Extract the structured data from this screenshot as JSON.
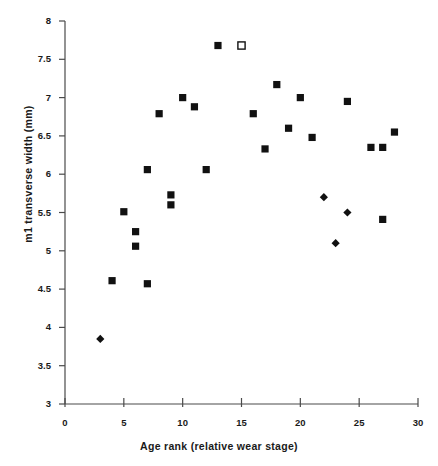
{
  "chart_data": {
    "type": "scatter",
    "title": "",
    "xlabel": "Age rank (relative wear stage)",
    "ylabel": "m1 transverse width  (mm)",
    "xlim": [
      0,
      30
    ],
    "ylim": [
      3,
      8
    ],
    "xticks": [
      0,
      5,
      10,
      15,
      20,
      25,
      30
    ],
    "yticks": [
      3,
      3.5,
      4,
      4.5,
      5,
      5.5,
      6,
      6.5,
      7,
      7.5,
      8
    ],
    "xtick_labels": [
      "0",
      "5",
      "10",
      "15",
      "20",
      "25",
      "30"
    ],
    "ytick_labels": [
      "3",
      "3.5",
      "4",
      "4.5",
      "5",
      "5.5",
      "6",
      "6.5",
      "7",
      "7.5",
      "8"
    ],
    "grid": false,
    "legend": null,
    "series": [
      {
        "name": "filled-square",
        "marker": "filled-square",
        "color": "#111111",
        "points": [
          {
            "x": 4.0,
            "y": 4.61
          },
          {
            "x": 5.0,
            "y": 5.51
          },
          {
            "x": 6.0,
            "y": 5.25
          },
          {
            "x": 6.0,
            "y": 5.06
          },
          {
            "x": 7.0,
            "y": 4.57
          },
          {
            "x": 7.0,
            "y": 6.06
          },
          {
            "x": 8.0,
            "y": 6.79
          },
          {
            "x": 9.0,
            "y": 5.73
          },
          {
            "x": 9.0,
            "y": 5.6
          },
          {
            "x": 10.0,
            "y": 7.0
          },
          {
            "x": 11.0,
            "y": 6.88
          },
          {
            "x": 12.0,
            "y": 6.06
          },
          {
            "x": 13.0,
            "y": 7.68
          },
          {
            "x": 16.0,
            "y": 6.79
          },
          {
            "x": 17.0,
            "y": 6.33
          },
          {
            "x": 18.0,
            "y": 7.17
          },
          {
            "x": 19.0,
            "y": 6.6
          },
          {
            "x": 20.0,
            "y": 7.0
          },
          {
            "x": 21.0,
            "y": 6.48
          },
          {
            "x": 24.0,
            "y": 6.95
          },
          {
            "x": 26.0,
            "y": 6.35
          },
          {
            "x": 27.0,
            "y": 6.35
          },
          {
            "x": 27.0,
            "y": 5.41
          },
          {
            "x": 28.0,
            "y": 6.55
          }
        ]
      },
      {
        "name": "diamond",
        "marker": "diamond",
        "color": "#111111",
        "points": [
          {
            "x": 3.0,
            "y": 3.85
          },
          {
            "x": 22.0,
            "y": 5.7
          },
          {
            "x": 23.0,
            "y": 5.1
          },
          {
            "x": 24.0,
            "y": 5.5
          }
        ]
      },
      {
        "name": "open-square",
        "marker": "open-square",
        "color": "#111111",
        "points": [
          {
            "x": 15.0,
            "y": 7.68
          }
        ]
      }
    ]
  }
}
